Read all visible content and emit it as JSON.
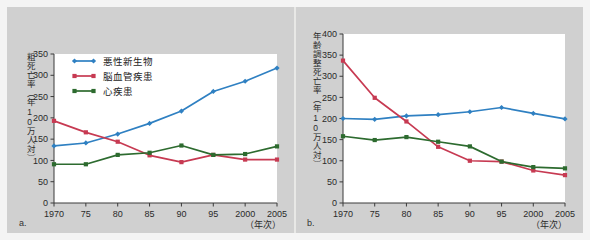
{
  "figure": {
    "background_color": "#d0d0d0",
    "plot_background": "#ffffff"
  },
  "panels": [
    {
      "key": "a",
      "label": "a.",
      "ylabel": "粗死亡率（年10万人対）",
      "xlabel": "（年次）"
    },
    {
      "key": "b",
      "label": "b.",
      "ylabel": "年齢調整死亡率（年10万人対）",
      "xlabel": "（年次）"
    }
  ],
  "legend": {
    "items": [
      {
        "label": "悪性新生物",
        "color": "#2f80c2",
        "marker": "diamond"
      },
      {
        "label": "脳血管疾患",
        "color": "#c73a52",
        "marker": "square"
      },
      {
        "label": "心疾患",
        "color": "#2d6b2f",
        "marker": "square"
      }
    ]
  },
  "chart_data": [
    {
      "type": "line",
      "panel": "a",
      "title": "",
      "xlabel": "（年次）",
      "ylabel": "粗死亡率（年10万人対）",
      "x": [
        1970,
        1975,
        1980,
        1985,
        1990,
        1995,
        2000,
        2005
      ],
      "categories": [
        "1970",
        "75",
        "80",
        "85",
        "90",
        "95",
        "2000",
        "2005"
      ],
      "ylim": [
        0,
        350
      ],
      "yticks": [
        0,
        50,
        100,
        150,
        200,
        250,
        300,
        350
      ],
      "grid": false,
      "legend_position": "top-left",
      "series": [
        {
          "name": "悪性新生物",
          "color": "#2f80c2",
          "values": [
            134,
            141,
            162,
            187,
            216,
            262,
            286,
            317
          ]
        },
        {
          "name": "脳血管疾患",
          "color": "#c73a52",
          "values": [
            193,
            166,
            144,
            112,
            96,
            113,
            102,
            102
          ]
        },
        {
          "name": "心疾患",
          "color": "#2d6b2f",
          "values": [
            91,
            91,
            113,
            118,
            135,
            113,
            115,
            133
          ]
        }
      ]
    },
    {
      "type": "line",
      "panel": "b",
      "title": "",
      "xlabel": "（年次）",
      "ylabel": "年齢調整死亡率（年10万人対）",
      "x": [
        1970,
        1975,
        1980,
        1985,
        1990,
        1995,
        2000,
        2005
      ],
      "categories": [
        "1970",
        "75",
        "80",
        "85",
        "90",
        "95",
        "2000",
        "2005"
      ],
      "ylim": [
        0,
        400
      ],
      "yticks": [
        0,
        50,
        100,
        150,
        200,
        250,
        300,
        350,
        400
      ],
      "grid": false,
      "legend_position": "none",
      "series": [
        {
          "name": "悪性新生物",
          "color": "#2f80c2",
          "values": [
            200,
            198,
            206,
            209,
            216,
            226,
            212,
            199
          ]
        },
        {
          "name": "脳血管疾患",
          "color": "#c73a52",
          "values": [
            337,
            249,
            193,
            133,
            100,
            98,
            77,
            66
          ]
        },
        {
          "name": "心疾患",
          "color": "#2d6b2f",
          "values": [
            158,
            149,
            156,
            145,
            134,
            98,
            85,
            82
          ]
        }
      ]
    }
  ]
}
